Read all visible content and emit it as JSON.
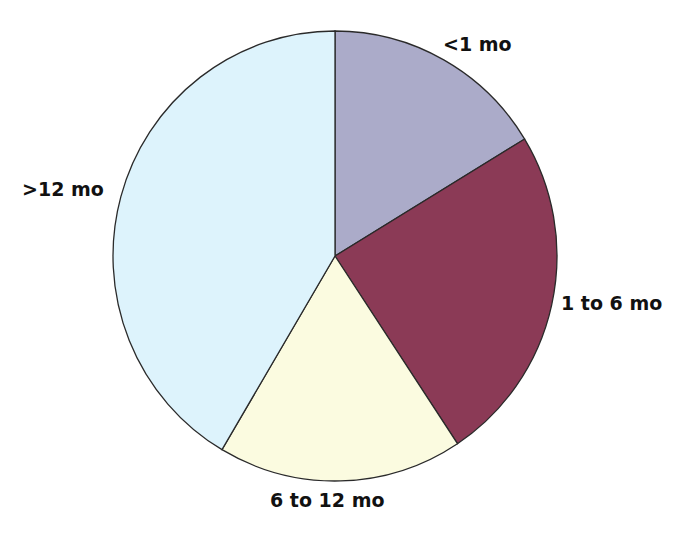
{
  "chart_data": {
    "type": "pie",
    "title": "",
    "categories": [
      "<1 mo",
      "1 to 6 mo",
      "6 to 12 mo",
      ">12 mo"
    ],
    "values": [
      16.3,
      24.4,
      17.8,
      41.5
    ],
    "unit": "percent (estimated from slice angles)",
    "start_angle_deg": 0,
    "direction": "clockwise",
    "colors": [
      "#ababc9",
      "#8b3a56",
      "#fbfbe0",
      "#ddf3fc"
    ],
    "legend": "none (direct slice labels)"
  },
  "labels": {
    "lt1": "<1 mo",
    "m1to6": "1 to 6 mo",
    "m6to12": "6 to 12 mo",
    "gt12": ">12 mo"
  },
  "style": {
    "outline": "#2a2a2a",
    "background": "#ffffff"
  }
}
